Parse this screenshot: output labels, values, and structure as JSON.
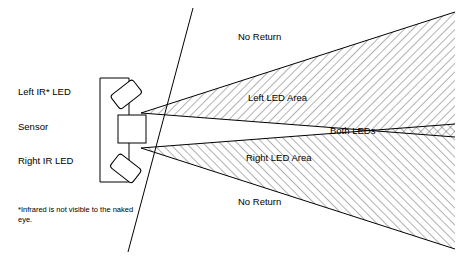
{
  "diagram": {
    "left_labels": [
      {
        "id": "left-ir-led",
        "text": "Left IR* LED",
        "x": 18,
        "y": 92
      },
      {
        "id": "sensor",
        "text": "Sensor",
        "x": 18,
        "y": 127
      },
      {
        "id": "right-ir-led",
        "text": "Right IR LED",
        "x": 18,
        "y": 160
      }
    ],
    "zone_labels": [
      {
        "id": "no-return-top",
        "text": "No Return",
        "x": 238,
        "y": 36
      },
      {
        "id": "left-led-area",
        "text": "Left LED Area",
        "x": 248,
        "y": 97
      },
      {
        "id": "both-leds",
        "text": "Both LEDs",
        "x": 330,
        "y": 130
      },
      {
        "id": "right-led-area",
        "text": "Right LED Area",
        "x": 246,
        "y": 157
      },
      {
        "id": "no-return-bottom",
        "text": "No Return",
        "x": 238,
        "y": 201
      }
    ],
    "footnote": "*Infrared is not visible to the naked eye.",
    "colors": {
      "stroke": "#000000",
      "hatch": "#555555",
      "background": "#ffffff"
    }
  }
}
